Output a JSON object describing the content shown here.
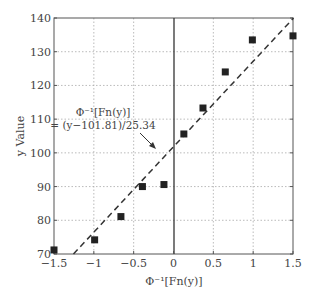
{
  "chart_data": {
    "type": "scatter",
    "title": "",
    "xlabel": "Φ⁻¹[Fn(y)]",
    "ylabel": "y Value",
    "xlim": [
      -1.5,
      1.5
    ],
    "ylim": [
      70,
      140
    ],
    "xticks": [
      -1.5,
      -1,
      -0.5,
      0,
      0.5,
      1,
      1.5
    ],
    "xtick_labels": [
      "-1.5",
      "-1",
      "-0.5",
      "0",
      "0.5",
      "1",
      "1.5"
    ],
    "yticks": [
      70,
      80,
      90,
      100,
      110,
      120,
      130,
      140
    ],
    "ytick_labels": [
      "70",
      "80",
      "90",
      "100",
      "110",
      "120",
      "130",
      "140"
    ],
    "grid": true,
    "series": [
      {
        "name": "observations",
        "marker": "square",
        "color": "#222222",
        "x": [
          -1.5,
          -0.99,
          -0.66,
          -0.39,
          -0.12,
          0.13,
          0.37,
          0.65,
          0.99,
          1.5
        ],
        "y": [
          71.2,
          74.2,
          81.1,
          90.0,
          90.6,
          105.6,
          113.3,
          124.0,
          133.5,
          134.7
        ]
      },
      {
        "name": "fit line",
        "style": "dashed",
        "color": "#222222",
        "equation": "Φ⁻¹[Fn(y)] = (y−101.81)/25.34",
        "slope": 25.34,
        "intercept": 101.81
      }
    ],
    "annotation": {
      "line1": "Φ⁻¹[Fn(y)]",
      "line2": "= (y−101.81)/25.34"
    }
  }
}
